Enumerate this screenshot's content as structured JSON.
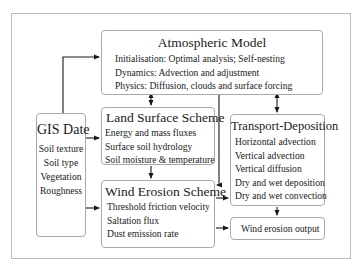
{
  "diagram": {
    "atmospheric_model": {
      "title": "Atmospheric Model",
      "items": [
        "Initialisation: Optimal analysis; Self-nesting",
        "Dynamics: Advection and adjustment",
        "Physics: Diffusion, clouds and surface forcing"
      ]
    },
    "land_surface_scheme": {
      "title": "Land Surface Scheme",
      "items": [
        "Energy and mass fluxes",
        "Surface soil hydrology",
        "Soil moisture & temperature"
      ]
    },
    "wind_erosion_scheme": {
      "title": "Wind Erosion Scheme",
      "items": [
        "Threshold friction velocity",
        "Saltation flux",
        "Dust emission rate"
      ]
    },
    "gis_data": {
      "title": "GIS Date",
      "items": [
        "Soil texture",
        "Soil type",
        "Vegetation",
        "Roughness"
      ]
    },
    "transport_deposition": {
      "title": "Transport-Deposition",
      "items": [
        "Horizontal advection",
        "Vertical advection",
        "Vertical diffusion",
        "Dry and wet deposition",
        "Dry and wet convection"
      ]
    },
    "output": {
      "label": "Wind erosion output"
    },
    "colors": {
      "box_border": "#a8a8a8",
      "frame_border": "#bdbdbd",
      "arrow": "#1a1a1a"
    }
  }
}
